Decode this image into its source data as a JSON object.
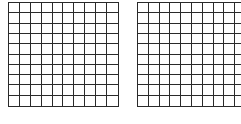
{
  "diagram": {
    "type": "hundred-grids",
    "grids": [
      {
        "id": "left",
        "rows": 10,
        "cols": 10,
        "shaded_cells": 0
      },
      {
        "id": "right",
        "rows": 10,
        "cols": 10,
        "shaded_cells": 0
      }
    ],
    "colors": {
      "line": "#2a2a2a",
      "background": "#ffffff"
    }
  }
}
